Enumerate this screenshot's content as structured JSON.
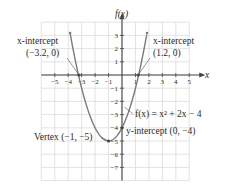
{
  "chart_data": {
    "type": "line",
    "title": "",
    "function": "f(x) = x^2 + 2x - 4",
    "xlabel": "x",
    "ylabel": "f(x)",
    "xlim": [
      -6,
      5
    ],
    "ylim": [
      -8,
      4
    ],
    "grid": true,
    "x_ticks": [
      -5,
      -4,
      -3,
      -2,
      -1,
      1,
      2,
      3,
      4,
      5
    ],
    "y_ticks": [
      3,
      2,
      1,
      -1,
      -2,
      -3,
      -4,
      -5,
      -6,
      -7
    ],
    "series": [
      {
        "name": "f(x) = x^2 + 2x - 4",
        "x": [
          -3.5,
          -3.2,
          -3,
          -2,
          -1,
          0,
          1,
          1.2,
          1.5
        ],
        "y": [
          1.25,
          0.04,
          -1,
          -4,
          -5,
          -4,
          -1,
          0.04,
          1.25
        ]
      }
    ],
    "annotations": [
      {
        "label": "x-intercept",
        "value": "(-3.2, 0)",
        "x": -3.2,
        "y": 0
      },
      {
        "label": "x-intercept",
        "value": "(1.2, 0)",
        "x": 1.2,
        "y": 0
      },
      {
        "label": "Vertex",
        "value": "(-1, -5)",
        "x": -1,
        "y": -5
      },
      {
        "label": "y-intercept",
        "value": "(0, -4)",
        "x": 0,
        "y": -4
      }
    ],
    "colors": {
      "curve": "#7a7a7a",
      "axes": "#444444",
      "grid": "#dcdcdc"
    }
  },
  "labels": {
    "y_axis": "f(x)",
    "x_axis": "x",
    "x_intercept_left_title": "x-intercept",
    "x_intercept_left_value": "(−3.2, 0)",
    "x_intercept_right_title": "x-intercept",
    "x_intercept_right_value": "(1.2, 0)",
    "equation": "f(x) = x² + 2x − 4",
    "vertex": "Vertex (−1, −5)",
    "y_intercept": "y-intercept (0, −4)"
  },
  "ticks": {
    "x": [
      "−5",
      "−4",
      "−3",
      "−2",
      "−1",
      "1",
      "2",
      "3",
      "4",
      "5"
    ],
    "y": [
      "3",
      "2",
      "1",
      "−1",
      "−2",
      "−3",
      "−4",
      "−5",
      "−6",
      "−7"
    ]
  }
}
